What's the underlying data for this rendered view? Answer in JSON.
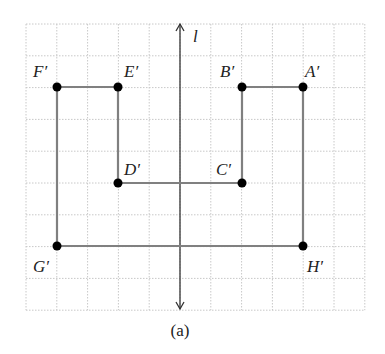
{
  "figure": {
    "caption": "(a)",
    "axis_label": "l",
    "grid": {
      "x0": 26,
      "y0": 24,
      "cols": 11,
      "rows": 9,
      "cell_w": 30.8,
      "cell_h": 31.8,
      "line_color": "#c8c8c8"
    },
    "axis": {
      "x": 180,
      "y_top": 24,
      "y_bottom": 309,
      "color": "#333333"
    },
    "polygon_color": "#808080",
    "point_color": "#000000",
    "points": [
      {
        "name": "A'",
        "x": 303,
        "y": 87,
        "label_dx": 2,
        "label_dy": -10
      },
      {
        "name": "B'",
        "x": 242,
        "y": 87,
        "label_dx": -22,
        "label_dy": -10
      },
      {
        "name": "C'",
        "x": 242,
        "y": 183,
        "label_dx": -26,
        "label_dy": -8
      },
      {
        "name": "D'",
        "x": 118,
        "y": 183,
        "label_dx": 6,
        "label_dy": -8
      },
      {
        "name": "E'",
        "x": 118,
        "y": 87,
        "label_dx": 6,
        "label_dy": -10
      },
      {
        "name": "F'",
        "x": 57,
        "y": 87,
        "label_dx": -24,
        "label_dy": -10
      },
      {
        "name": "G'",
        "x": 57,
        "y": 246,
        "label_dx": -24,
        "label_dy": 26
      },
      {
        "name": "H'",
        "x": 303,
        "y": 246,
        "label_dx": 4,
        "label_dy": 26
      }
    ],
    "polygon_order": [
      "A'",
      "B'",
      "C'",
      "D'",
      "E'",
      "F'",
      "G'",
      "H'"
    ]
  }
}
